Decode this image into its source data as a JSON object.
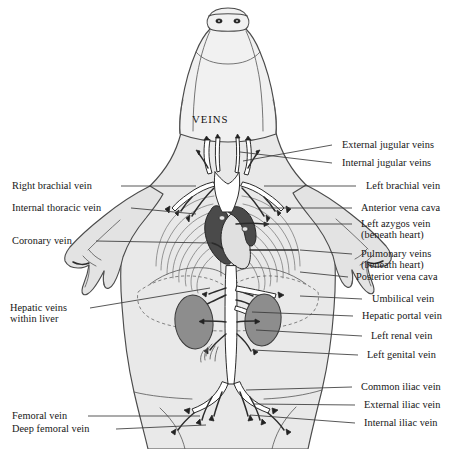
{
  "figure": {
    "title": "VEINS",
    "colors": {
      "background": "#ffffff",
      "body_fill": "#e9e9e9",
      "head_fill": "#f1f1f1",
      "limb_fill": "#e3e3e3",
      "outline": "#4b4b4b",
      "vessel_outline": "#2b2b2b",
      "vessel_fill": "#ffffff",
      "heart_dark": "#4a4a4a",
      "kidney_fill": "#8d8d8d",
      "liver_dash": "#6f6f6f",
      "leader_line": "#3a3a3a",
      "text": "#161616"
    }
  },
  "labels_left": [
    {
      "text": "Right brachial vein",
      "x": 12,
      "y": 181,
      "leader": {
        "x1": 121,
        "y1": 186,
        "x2": 196,
        "y2": 186
      }
    },
    {
      "text": "Internal thoracic vein",
      "x": 12,
      "y": 203,
      "leader": {
        "x1": 131,
        "y1": 208,
        "x2": 196,
        "y2": 214
      }
    },
    {
      "text": "Coronary vein",
      "x": 12,
      "y": 236,
      "leader": {
        "x1": 96,
        "y1": 241,
        "x2": 211,
        "y2": 243
      }
    },
    {
      "text": "Hepatic veins",
      "text2": "within liver",
      "x": 10,
      "y": 303,
      "leader": {
        "x1": 90,
        "y1": 308,
        "x2": 210,
        "y2": 288
      }
    },
    {
      "text": "Femoral vein",
      "x": 12,
      "y": 411,
      "leader": {
        "x1": 88,
        "y1": 416,
        "x2": 200,
        "y2": 416
      }
    },
    {
      "text": "Deep femoral vein",
      "x": 12,
      "y": 424,
      "leader": {
        "x1": 116,
        "y1": 429,
        "x2": 206,
        "y2": 425
      }
    }
  ],
  "labels_right": [
    {
      "text": "External jugular veins",
      "x": 342,
      "y": 140,
      "leader": {
        "x1": 332,
        "y1": 145,
        "x2": 243,
        "y2": 161
      }
    },
    {
      "text": "Internal jugular veins",
      "x": 342,
      "y": 158,
      "leader": {
        "x1": 332,
        "y1": 163,
        "x2": 240,
        "y2": 152
      }
    },
    {
      "text": "Left brachial vein",
      "x": 366,
      "y": 181,
      "leader": {
        "x1": 356,
        "y1": 186,
        "x2": 264,
        "y2": 186
      }
    },
    {
      "text": "Anterior vena cava",
      "x": 361,
      "y": 203,
      "leader": {
        "x1": 352,
        "y1": 208,
        "x2": 258,
        "y2": 208
      }
    },
    {
      "text": "Left azygos vein",
      "text2": "(beneath heart)",
      "x": 361,
      "y": 219,
      "leader": {
        "x1": 352,
        "y1": 224,
        "x2": 264,
        "y2": 224
      }
    },
    {
      "text": "Pulmonary veins",
      "text2": "(beneath heart)",
      "x": 361,
      "y": 249,
      "leader": {
        "x1": 352,
        "y1": 254,
        "x2": 300,
        "y2": 250
      }
    },
    {
      "text": "Posterior vena cava",
      "x": 356,
      "y": 272,
      "leader": {
        "x1": 348,
        "y1": 277,
        "x2": 300,
        "y2": 272
      }
    },
    {
      "text": "Umbilical vein",
      "x": 372,
      "y": 294,
      "leader": {
        "x1": 362,
        "y1": 299,
        "x2": 300,
        "y2": 296
      }
    },
    {
      "text": "Hepatic portal vein",
      "x": 362,
      "y": 311,
      "leader": {
        "x1": 353,
        "y1": 316,
        "x2": 252,
        "y2": 312
      }
    },
    {
      "text": "Left renal vein",
      "x": 371,
      "y": 331,
      "leader": {
        "x1": 362,
        "y1": 336,
        "x2": 256,
        "y2": 330
      }
    },
    {
      "text": "Left genital vein",
      "x": 367,
      "y": 350,
      "leader": {
        "x1": 358,
        "y1": 355,
        "x2": 252,
        "y2": 350
      }
    },
    {
      "text": "Common iliac vein",
      "x": 361,
      "y": 382,
      "leader": {
        "x1": 352,
        "y1": 387,
        "x2": 246,
        "y2": 390
      }
    },
    {
      "text": "External iliac vein",
      "x": 364,
      "y": 400,
      "leader": {
        "x1": 355,
        "y1": 405,
        "x2": 254,
        "y2": 404
      }
    },
    {
      "text": "Internal iliac vein",
      "x": 364,
      "y": 418,
      "leader": {
        "x1": 355,
        "y1": 423,
        "x2": 250,
        "y2": 415
      }
    }
  ],
  "anatomy_parts": [
    {
      "name": "head-snout",
      "kind": "outline"
    },
    {
      "name": "nostrils",
      "kind": "detail"
    },
    {
      "name": "body-trunk",
      "kind": "outline"
    },
    {
      "name": "left-forelimb",
      "kind": "outline"
    },
    {
      "name": "right-forelimb",
      "kind": "outline"
    },
    {
      "name": "hind-limbs",
      "kind": "outline"
    },
    {
      "name": "rib-cage",
      "kind": "detail"
    },
    {
      "name": "heart",
      "kind": "organ"
    },
    {
      "name": "diaphragm",
      "kind": "detail"
    },
    {
      "name": "liver-outline",
      "kind": "organ"
    },
    {
      "name": "left-kidney",
      "kind": "organ"
    },
    {
      "name": "right-kidney",
      "kind": "organ"
    },
    {
      "name": "venous-tree",
      "kind": "vessels"
    }
  ]
}
